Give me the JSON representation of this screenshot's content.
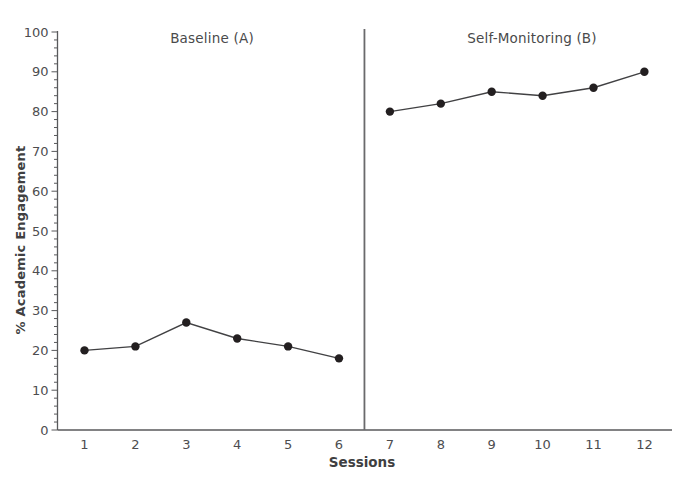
{
  "chart_data": {
    "type": "line",
    "title": "",
    "xlabel": "Sessions",
    "ylabel": "% Academic Engagement",
    "ylim": [
      0,
      100
    ],
    "y_major_tick_step": 10,
    "y_minor_tick_step": 2,
    "y_tick_labels": [
      0,
      10,
      20,
      30,
      40,
      50,
      60,
      70,
      80,
      90,
      100
    ],
    "x_ticks": [
      1,
      2,
      3,
      4,
      5,
      6,
      7,
      8,
      9,
      10,
      11,
      12
    ],
    "grid": false,
    "legend": "none",
    "marker": "filled-circle",
    "phase_divider_between": [
      6,
      7
    ],
    "phases": [
      {
        "label": "Baseline (A)",
        "sessions": [
          1,
          2,
          3,
          4,
          5,
          6
        ],
        "values": [
          20,
          21,
          27,
          23,
          21,
          18
        ]
      },
      {
        "label": "Self-Monitoring (B)",
        "sessions": [
          7,
          8,
          9,
          10,
          11,
          12
        ],
        "values": [
          80,
          82,
          85,
          84,
          86,
          90
        ]
      }
    ],
    "colors": {
      "marker": "#231f20",
      "line": "#414143",
      "axis": "#58595b",
      "divider": "#6a6a6c",
      "tick_text": "#4d4d4f"
    }
  }
}
